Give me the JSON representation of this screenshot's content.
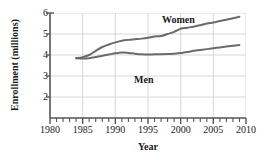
{
  "chart_data": {
    "type": "line",
    "title": "",
    "xlabel": "Year",
    "ylabel": "Enrollment (millions)",
    "xlim": [
      1980,
      2010
    ],
    "ylim": [
      1,
      6
    ],
    "xticks": [
      1980,
      1985,
      1990,
      1995,
      2000,
      2005,
      2010
    ],
    "xticklabels": [
      "1980",
      "1985",
      "1990",
      "1995",
      "2000",
      "2005",
      "2010"
    ],
    "minor_xtick_interval": 1,
    "yticks": [
      2,
      3,
      4,
      5,
      6
    ],
    "yticklabels": [
      "2",
      "3",
      "4",
      "5",
      "6"
    ],
    "grid": true,
    "grid_color": "#d8d8d8",
    "line_color": "#6a6a6a",
    "legend": "inline-annotations",
    "series": [
      {
        "name": "Women",
        "label_text": "Women",
        "x": [
          1984,
          1985,
          1986,
          1987,
          1988,
          1989,
          1990,
          1991,
          1992,
          1993,
          1994,
          1995,
          1996,
          1997,
          1998,
          1999,
          2000,
          2001,
          2002,
          2003,
          2004,
          2005,
          2006,
          2007,
          2008,
          2009
        ],
        "values": [
          3.85,
          3.9,
          4.0,
          4.2,
          4.38,
          4.5,
          4.6,
          4.68,
          4.72,
          4.75,
          4.78,
          4.82,
          4.88,
          4.9,
          5.0,
          5.1,
          5.25,
          5.3,
          5.35,
          5.42,
          5.5,
          5.55,
          5.62,
          5.68,
          5.75,
          5.82
        ]
      },
      {
        "name": "Men",
        "label_text": "Men",
        "x": [
          1984,
          1985,
          1986,
          1987,
          1988,
          1989,
          1990,
          1991,
          1992,
          1993,
          1994,
          1995,
          1996,
          1997,
          1998,
          1999,
          2000,
          2001,
          2002,
          2003,
          2004,
          2005,
          2006,
          2007,
          2008,
          2009
        ],
        "values": [
          3.85,
          3.83,
          3.85,
          3.9,
          3.96,
          4.02,
          4.08,
          4.12,
          4.1,
          4.06,
          4.03,
          4.02,
          4.03,
          4.04,
          4.05,
          4.06,
          4.1,
          4.14,
          4.2,
          4.24,
          4.28,
          4.32,
          4.36,
          4.4,
          4.44,
          4.48
        ]
      }
    ]
  }
}
